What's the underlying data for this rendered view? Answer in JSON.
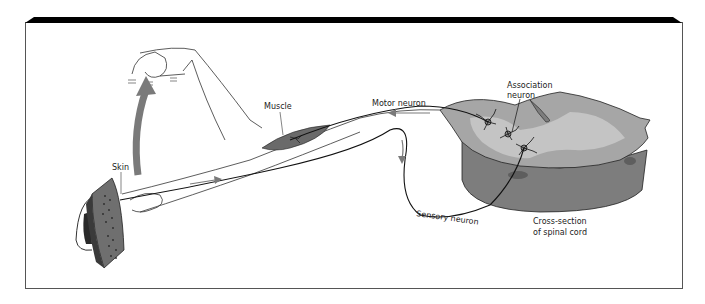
{
  "figure": {
    "labels": {
      "association": [
        "Association",
        "neuron"
      ],
      "muscle": "Muscle",
      "motor": "Motor neuron",
      "skin": "Skin",
      "sensory": "Sensory neuron",
      "cord": [
        "Cross-section",
        "of spinal cord"
      ]
    },
    "colors": {
      "frame_bar": "#000000",
      "frame_border": "#555555",
      "line": "#222222",
      "arrow_gray": "#7a7a7a",
      "cord_top": "#a6a6a6",
      "cord_light": "#c4c4c4",
      "cord_side": "#7d7d7d",
      "cord_dark": "#5e5e5e",
      "muscle": "#6a6a6a",
      "iron": "#6f6f6f",
      "iron_dark": "#3a3a3a"
    }
  }
}
